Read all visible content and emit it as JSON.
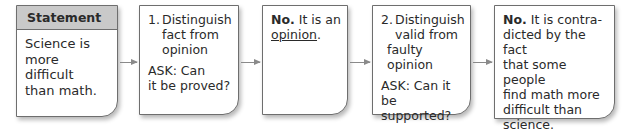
{
  "diagram": {
    "type": "flowchart",
    "direction": "left-to-right",
    "boxes": [
      {
        "id": "statement",
        "header": "Statement",
        "text": [
          "Science is",
          "more difficult",
          "than math."
        ]
      },
      {
        "id": "step1",
        "number": "1.",
        "title": [
          "Distinguish",
          "fact from",
          "opinion"
        ],
        "ask": [
          "ASK: Can",
          "it be proved?"
        ]
      },
      {
        "id": "answer1",
        "bold": "No.",
        "text_line1": " It is an",
        "underlined": "opinion",
        "trailing": "."
      },
      {
        "id": "step2",
        "number": "2.",
        "title": [
          "Distinguish",
          "valid from",
          "faulty opinion"
        ],
        "ask": [
          "ASK: Can it",
          "be supported?"
        ]
      },
      {
        "id": "answer2",
        "bold": "No.",
        "text_line1": " It is contra-",
        "lines": [
          "dicted by the fact",
          "that some people",
          "find math more",
          "difficult than",
          "science."
        ]
      }
    ],
    "arrows": [
      {
        "from": "statement",
        "to": "step1"
      },
      {
        "from": "step1",
        "to": "answer1"
      },
      {
        "from": "answer1",
        "to": "step2"
      },
      {
        "from": "step2",
        "to": "answer2"
      }
    ],
    "colors": {
      "header_bg": "#c9c9c9",
      "border": "#6e6e6e",
      "arrow": "#8a8a8a"
    }
  }
}
